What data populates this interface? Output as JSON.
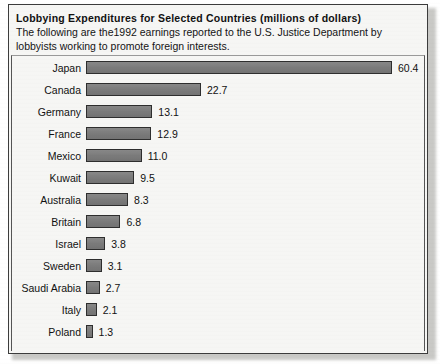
{
  "chart_data": {
    "type": "bar",
    "orientation": "horizontal",
    "title": "Lobbying Expenditures for Selected Countries (millions of dollars)",
    "subtitle": "The following are the1992 earnings reported to the U.S. Justice Department by lobbyists working to promote foreign interests.",
    "xlabel": "",
    "ylabel": "",
    "unit": "millions of dollars",
    "grid": false,
    "legend": "none",
    "xlim": [
      0,
      60.4
    ],
    "categories": [
      "Japan",
      "Canada",
      "Germany",
      "France",
      "Mexico",
      "Kuwait",
      "Australia",
      "Britain",
      "Israel",
      "Sweden",
      "Saudi Arabia",
      "Italy",
      "Poland"
    ],
    "values": [
      60.4,
      22.7,
      13.1,
      12.9,
      11.0,
      9.5,
      8.3,
      6.8,
      3.8,
      3.1,
      2.7,
      2.1,
      1.3
    ],
    "value_labels": [
      "60.4",
      "22.7",
      "13.1",
      "12.9",
      "11.0",
      "9.5",
      "8.3",
      "6.8",
      "3.8",
      "3.1",
      "2.7",
      "2.1",
      "1.3"
    ],
    "rows": [
      {
        "label": "Japan",
        "value": 60.4,
        "value_label": "60.4"
      },
      {
        "label": "Canada",
        "value": 22.7,
        "value_label": "22.7"
      },
      {
        "label": "Germany",
        "value": 13.1,
        "value_label": "13.1"
      },
      {
        "label": "France",
        "value": 12.9,
        "value_label": "12.9"
      },
      {
        "label": "Mexico",
        "value": 11.0,
        "value_label": "11.0"
      },
      {
        "label": "Kuwait",
        "value": 9.5,
        "value_label": "9.5"
      },
      {
        "label": "Australia",
        "value": 8.3,
        "value_label": "8.3"
      },
      {
        "label": "Britain",
        "value": 6.8,
        "value_label": "6.8"
      },
      {
        "label": "Israel",
        "value": 3.8,
        "value_label": "3.8"
      },
      {
        "label": "Sweden",
        "value": 3.1,
        "value_label": "3.1"
      },
      {
        "label": "Saudi Arabia",
        "value": 2.7,
        "value_label": "2.7"
      },
      {
        "label": "Italy",
        "value": 2.1,
        "value_label": "2.1"
      },
      {
        "label": "Poland",
        "value": 1.3,
        "value_label": "1.3"
      }
    ],
    "colors": {
      "bar_fill": "#7c7c7c",
      "bar_border": "#2e2e2e",
      "panel_background": "#f6f6f4",
      "panel_border": "#3c3c3c",
      "text": "#111111"
    }
  }
}
